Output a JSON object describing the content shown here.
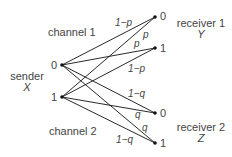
{
  "diagram": {
    "sender": {
      "label": "sender",
      "variable": "X",
      "nodes": [
        {
          "id": "x0",
          "label": "0"
        },
        {
          "id": "x1",
          "label": "1"
        }
      ]
    },
    "receiver1": {
      "label": "receiver 1",
      "variable": "Y",
      "nodes": [
        {
          "id": "y0",
          "label": "0"
        },
        {
          "id": "y1",
          "label": "1"
        }
      ]
    },
    "receiver2": {
      "label": "receiver 2",
      "variable": "Z",
      "nodes": [
        {
          "id": "z0",
          "label": "0"
        },
        {
          "id": "z1",
          "label": "1"
        }
      ]
    },
    "channels": [
      {
        "label": "channel 1",
        "edges": [
          {
            "from": "x0",
            "to": "y0",
            "label": "1−p"
          },
          {
            "from": "x1",
            "to": "y0",
            "label": "p"
          },
          {
            "from": "x0",
            "to": "y1",
            "label": "p"
          },
          {
            "from": "x1",
            "to": "y1",
            "label": "1−p"
          }
        ]
      },
      {
        "label": "channel 2",
        "edges": [
          {
            "from": "x0",
            "to": "z0",
            "label": "1−q"
          },
          {
            "from": "x1",
            "to": "z0",
            "label": "q"
          },
          {
            "from": "x0",
            "to": "z1",
            "label": "q"
          },
          {
            "from": "x1",
            "to": "z1",
            "label": "1−q"
          }
        ]
      }
    ]
  }
}
